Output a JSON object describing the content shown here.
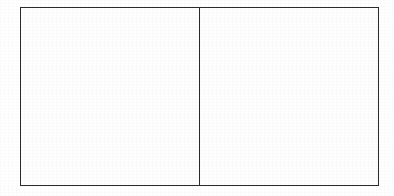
{
  "document": {
    "kind": "line-drawing",
    "title": "",
    "background_color": "#ffffff",
    "width": 394,
    "height": 196
  },
  "figure": {
    "name": "two-panel-rectangle",
    "stroke_color": "#2b2b2b",
    "fill_color": "#fefefe",
    "stroke_width_px": 1.5,
    "outer_rect": {
      "x": 20,
      "y": 7,
      "width": 359,
      "height": 179
    },
    "divider": {
      "orientation": "vertical",
      "x": 200,
      "y_start": 7,
      "y_end": 186
    },
    "panels": [
      {
        "id": "left",
        "label": "",
        "content": "",
        "x": 20,
        "y": 7,
        "width": 180,
        "height": 179,
        "empty": true
      },
      {
        "id": "right",
        "label": "",
        "content": "",
        "x": 200,
        "y": 7,
        "width": 179,
        "height": 179,
        "empty": true
      }
    ]
  }
}
